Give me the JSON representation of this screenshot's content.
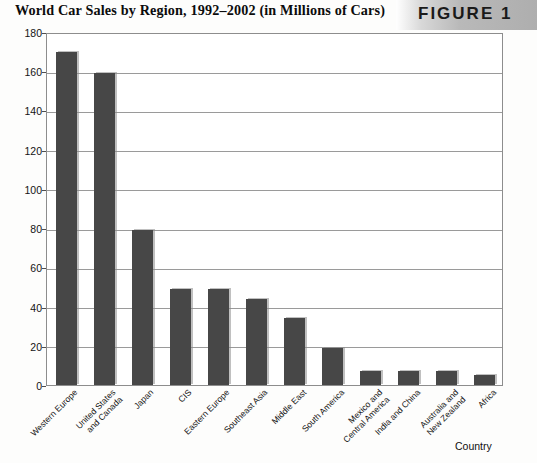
{
  "header": {
    "title": "World Car Sales by Region, 1992–2002 (in Millions of Cars)",
    "figure_label": "FIGURE 1"
  },
  "colors": {
    "bar_fill": "#474747",
    "gridline": "#9a9a9a",
    "plot_border": "#8d8d8d",
    "band": "#b9b9b9",
    "text": "#141414"
  },
  "chart_data": {
    "type": "bar",
    "title": "World Car Sales by Region, 1992–2002 (in Millions of Cars)",
    "xlabel": "Country",
    "ylabel": "",
    "ylim": [
      0,
      180
    ],
    "yticks": [
      0,
      20,
      40,
      60,
      80,
      100,
      120,
      140,
      160,
      180
    ],
    "ytick_labels": [
      "0",
      "20",
      "40",
      "60",
      "80",
      "100",
      "120",
      "140",
      "160",
      "180"
    ],
    "grid": true,
    "legend": false,
    "categories": [
      "Western Europe",
      "United States\nand Canada",
      "Japan",
      "CIS",
      "Eastern Europe",
      "Southeast Asia",
      "Middle East",
      "South America",
      "Mexico and\nCentral America",
      "India and China",
      "Australia and\nNew Zealand",
      "Africa"
    ],
    "values": [
      170,
      159,
      79,
      49,
      49,
      44,
      34,
      19,
      7,
      7,
      7,
      5
    ]
  }
}
